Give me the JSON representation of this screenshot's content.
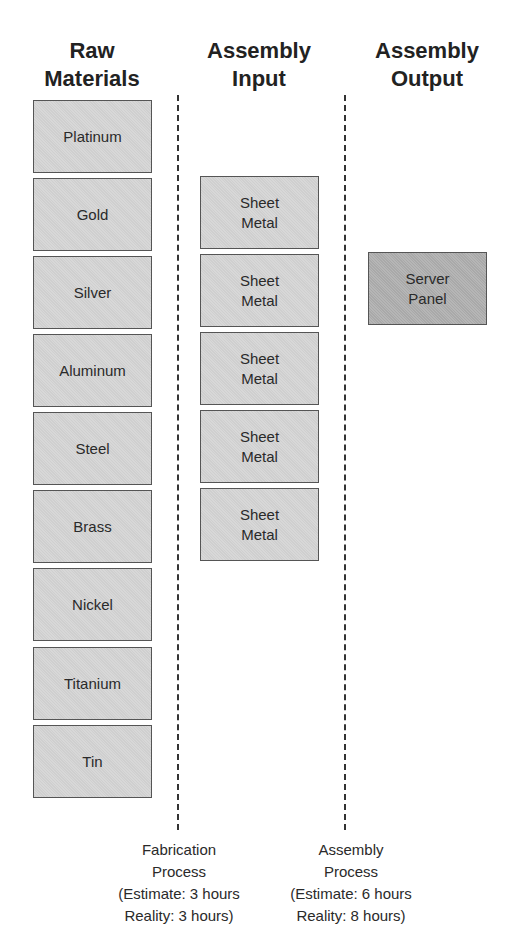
{
  "columns": [
    {
      "header_line1": "Raw",
      "header_line2": "Materials"
    },
    {
      "header_line1": "Assembly",
      "header_line2": "Input"
    },
    {
      "header_line1": "Assembly",
      "header_line2": "Output"
    }
  ],
  "raw_materials": [
    "Platinum",
    "Gold",
    "Silver",
    "Aluminum",
    "Steel",
    "Brass",
    "Nickel",
    "Titanium",
    "Tin"
  ],
  "assembly_input": [
    {
      "line1": "Sheet",
      "line2": "Metal"
    },
    {
      "line1": "Sheet",
      "line2": "Metal"
    },
    {
      "line1": "Sheet",
      "line2": "Metal"
    },
    {
      "line1": "Sheet",
      "line2": "Metal"
    },
    {
      "line1": "Sheet",
      "line2": "Metal"
    }
  ],
  "assembly_output": [
    {
      "line1": "Server",
      "line2": "Panel"
    }
  ],
  "processes": [
    {
      "line1": "Fabrication",
      "line2": "Process",
      "line3": "(Estimate: 3 hours",
      "line4": "Reality: 3 hours)"
    },
    {
      "line1": "Assembly",
      "line2": "Process",
      "line3": "(Estimate: 6 hours",
      "line4": "Reality: 8 hours)"
    }
  ],
  "colors": {
    "box_fill": "#cfcfcf",
    "output_box_fill": "#a9a9a9",
    "border": "#555555"
  }
}
